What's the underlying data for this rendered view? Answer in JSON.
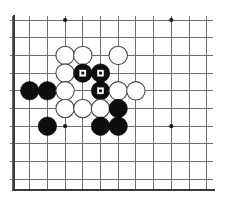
{
  "diagram": {
    "type": "go-board",
    "board": {
      "background_color": "#ffffff",
      "line_color": "#6e6e6e",
      "edge_color": "#3a3a3a",
      "origin_x": 12,
      "origin_y": 20,
      "spacing": 17.7,
      "columns": 12,
      "rows": 10,
      "left_edge_is_board_edge": true,
      "bottom_edge_is_board_edge": true,
      "star_points": [
        {
          "col": 3,
          "row": 0
        },
        {
          "col": 9,
          "row": 0
        },
        {
          "col": 3,
          "row": 6
        },
        {
          "col": 9,
          "row": 6
        }
      ]
    },
    "stones": [
      {
        "col": 3,
        "row": 2,
        "color": "white",
        "mark": "none"
      },
      {
        "col": 4,
        "row": 2,
        "color": "white",
        "mark": "none"
      },
      {
        "col": 6,
        "row": 2,
        "color": "white",
        "mark": "none"
      },
      {
        "col": 3,
        "row": 3,
        "color": "white",
        "mark": "none"
      },
      {
        "col": 4,
        "row": 3,
        "color": "black",
        "mark": "square"
      },
      {
        "col": 5,
        "row": 3,
        "color": "black",
        "mark": "square"
      },
      {
        "col": 1,
        "row": 4,
        "color": "black",
        "mark": "none"
      },
      {
        "col": 2,
        "row": 4,
        "color": "black",
        "mark": "none"
      },
      {
        "col": 3,
        "row": 4,
        "color": "white",
        "mark": "none"
      },
      {
        "col": 5,
        "row": 4,
        "color": "black",
        "mark": "square"
      },
      {
        "col": 6,
        "row": 4,
        "color": "white",
        "mark": "none"
      },
      {
        "col": 7,
        "row": 4,
        "color": "white",
        "mark": "none"
      },
      {
        "col": 3,
        "row": 5,
        "color": "white",
        "mark": "none"
      },
      {
        "col": 4,
        "row": 5,
        "color": "white",
        "mark": "none"
      },
      {
        "col": 5,
        "row": 5,
        "color": "white",
        "mark": "none"
      },
      {
        "col": 6,
        "row": 5,
        "color": "black",
        "mark": "none"
      },
      {
        "col": 2,
        "row": 6,
        "color": "black",
        "mark": "none"
      },
      {
        "col": 5,
        "row": 6,
        "color": "black",
        "mark": "none"
      },
      {
        "col": 6,
        "row": 6,
        "color": "black",
        "mark": "none"
      }
    ],
    "stone_radius": 9.2,
    "marker_size": 6.2,
    "colors": {
      "black_stone": "#0d0d0d",
      "white_stone": "#ffffff",
      "white_stone_outline": "#4a4a4a",
      "marker": "#ffffff",
      "grid": "#6e6e6e",
      "star": "#1a1a1a"
    }
  }
}
